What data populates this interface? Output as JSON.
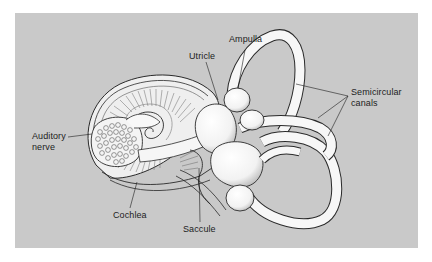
{
  "figure": {
    "background_color": "#c9c9c9",
    "labels": {
      "ampulla": "Ampulla",
      "utricle": "Utricle",
      "semicircular_canals_line1": "Semicircular",
      "semicircular_canals_line2": "canals",
      "auditory_nerve_line1": "Auditory",
      "auditory_nerve_line2": "nerve",
      "cochlea": "Cochlea",
      "saccule": "Saccule"
    }
  }
}
